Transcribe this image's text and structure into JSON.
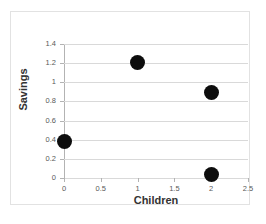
{
  "chart_data": {
    "type": "scatter",
    "title": "",
    "xlabel": "Children",
    "ylabel": "Savings",
    "xlim": [
      0,
      2.5
    ],
    "ylim": [
      0,
      1.4
    ],
    "grid": "horizontal",
    "legend": "none",
    "x_ticks": [
      "0",
      "0.5",
      "1",
      "1.5",
      "2",
      "2.5"
    ],
    "x_tick_values": [
      0,
      0.5,
      1,
      1.5,
      2,
      2.5
    ],
    "y_ticks": [
      "0",
      "0.2",
      "0.4",
      "0.6",
      "0.8",
      "1",
      "1.2",
      "1.4"
    ],
    "y_tick_values": [
      0,
      0.2,
      0.4,
      0.6,
      0.8,
      1,
      1.2,
      1.4
    ],
    "points": [
      {
        "x": 0,
        "y": 0.38
      },
      {
        "x": 1,
        "y": 1.21
      },
      {
        "x": 2,
        "y": 0.89
      },
      {
        "x": 2,
        "y": 0.04
      }
    ],
    "marker_color": "#0d0d0d",
    "marker_size_px": 15,
    "gridline_color": "#d9d9d9",
    "axis_color": "#b3b3b3",
    "background_color": "#ffffff",
    "frame_color": "#e2e2e2"
  }
}
